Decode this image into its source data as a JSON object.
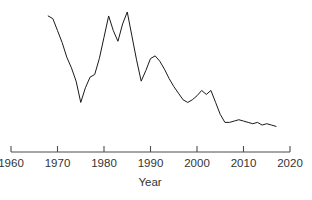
{
  "chart_data": {
    "type": "line",
    "title": "",
    "subtitle": "",
    "xlabel": "Year",
    "ylabel": "",
    "grid": false,
    "legend": "none",
    "xlim": [
      1960,
      2020
    ],
    "ylim": [
      0,
      100
    ],
    "xticks": [
      1960,
      1970,
      1980,
      1990,
      2000,
      2010,
      2020
    ],
    "xtick_labels": [
      "1960",
      "1970",
      "1980",
      "1990",
      "2000",
      "2010",
      "2020"
    ],
    "yticks": [],
    "ytick_labels": [],
    "annotations": [],
    "series": [
      {
        "name": "series-1",
        "color": "#1a1a1a",
        "x": [
          1968,
          1969,
          1970,
          1971,
          1972,
          1973,
          1974,
          1975,
          1976,
          1977,
          1978,
          1979,
          1980,
          1981,
          1982,
          1983,
          1984,
          1985,
          1986,
          1987,
          1988,
          1989,
          1990,
          1991,
          1992,
          1993,
          1994,
          1995,
          1996,
          1997,
          1998,
          1999,
          2000,
          2001,
          2002,
          2003,
          2004,
          2005,
          2006,
          2007,
          2008,
          2009,
          2010,
          2011,
          2012,
          2013,
          2014,
          2015,
          2016,
          2017
        ],
        "values": [
          94,
          92,
          83,
          74,
          63,
          55,
          45,
          29,
          40,
          48,
          50,
          62,
          78,
          94,
          83,
          75,
          88,
          97,
          79,
          61,
          45,
          53,
          62,
          64,
          60,
          54,
          47,
          41,
          36,
          31,
          29,
          31,
          34,
          38,
          35,
          38,
          29,
          20,
          14,
          14,
          15,
          16,
          15,
          14,
          13,
          14,
          12,
          13,
          12,
          11
        ]
      }
    ]
  },
  "axis": {
    "x_title": "Year"
  }
}
